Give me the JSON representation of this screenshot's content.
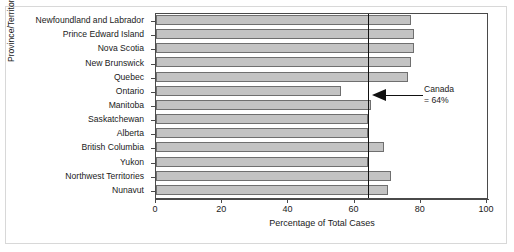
{
  "chart_data": {
    "type": "bar",
    "orientation": "horizontal",
    "title": "",
    "xlabel": "Percentage of Total Cases",
    "ylabel": "Province/Territory",
    "xlim": [
      0,
      100
    ],
    "xticks": [
      0,
      20,
      40,
      60,
      80,
      100
    ],
    "grid": false,
    "legend": null,
    "categories": [
      "Newfoundland and Labrador",
      "Prince Edward Island",
      "Nova Scotia",
      "New Brunswick",
      "Quebec",
      "Ontario",
      "Manitoba",
      "Saskatchewan",
      "Alberta",
      "British Columbia",
      "Yukon",
      "Northwest Territories",
      "Nunavut"
    ],
    "values": [
      77,
      78,
      78,
      77,
      76,
      56,
      65,
      64,
      64,
      69,
      64,
      71,
      70
    ],
    "bar_color": "#c3c3c3",
    "bar_edge_color": "#6f6f6f",
    "reference_line": {
      "value": 64,
      "label_line1": "Canada",
      "label_line2": "= 64%",
      "color": "#111111"
    }
  }
}
